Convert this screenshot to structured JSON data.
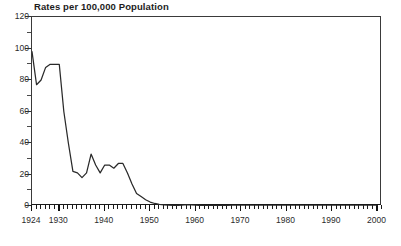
{
  "chart_data": {
    "type": "line",
    "title": "Rates per 100,000 Population",
    "xlabel": "",
    "ylabel": "",
    "xlim": [
      1924,
      2001
    ],
    "ylim": [
      0,
      120
    ],
    "yticks": [
      0,
      20,
      40,
      60,
      80,
      100,
      120
    ],
    "xticks": [
      1924,
      1930,
      1940,
      1950,
      1960,
      1970,
      1980,
      1990,
      2000
    ],
    "xtick_minor_step": 1,
    "grid": false,
    "legend": null,
    "line_color": "#2a2a2a",
    "series": [
      {
        "name": "Rate per 100,000 Population",
        "x": [
          1924,
          1925,
          1926,
          1927,
          1928,
          1929,
          1930,
          1931,
          1932,
          1933,
          1934,
          1935,
          1936,
          1937,
          1938,
          1939,
          1940,
          1941,
          1942,
          1943,
          1944,
          1945,
          1946,
          1947,
          1948,
          1949,
          1950,
          1951,
          1952,
          1953,
          1954,
          1955,
          1956,
          1957,
          1958,
          1959,
          1960,
          1961,
          1962,
          1963,
          1964,
          1965,
          1966,
          1967,
          1968,
          1969,
          1970,
          1971,
          1972,
          1973,
          1974,
          1975,
          1976,
          1977,
          1978,
          1979,
          1980,
          1981,
          1982,
          1983,
          1984,
          1985,
          1986,
          1987,
          1988,
          1989,
          1990,
          1991,
          1992,
          1993,
          1994,
          1995,
          1996,
          1997,
          1998,
          1999,
          2000
        ],
        "y": [
          98,
          77,
          80,
          88,
          90,
          90,
          90,
          60,
          40,
          22,
          21,
          18,
          21,
          33,
          26,
          21,
          26,
          26,
          24,
          27,
          27,
          21,
          14,
          8,
          6,
          4,
          2.5,
          1.6,
          1.0,
          0.7,
          0.5,
          0.4,
          0.35,
          0.6,
          0.8,
          0.7,
          0.5,
          0.35,
          0.3,
          0.25,
          0.2,
          0.2,
          0.2,
          0.2,
          0.15,
          0.15,
          0.15,
          0.12,
          0.1,
          0.1,
          0.1,
          0.1,
          0.1,
          0.1,
          0.1,
          0.1,
          0.1,
          0.1,
          0.1,
          0.1,
          0.1,
          0.1,
          0.1,
          0.1,
          0.1,
          0.1,
          0.1,
          0.1,
          0.1,
          0.1,
          0.1,
          0.1,
          0.1,
          0.1,
          0.1,
          0.1,
          0.1
        ]
      }
    ]
  },
  "caption": {
    "clipped_text": ""
  }
}
